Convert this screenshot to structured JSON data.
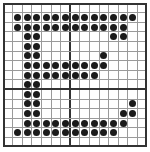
{
  "figure": {
    "grid": {
      "rows": 15,
      "cols": 15,
      "cell_px": 9.6,
      "thick_vertical_line_index": 7,
      "thick_horizontal_line_index": 9
    },
    "colors": {
      "dot": "#1a1a1a",
      "grid_line": "#9a9a9a",
      "thick_line": "#333333",
      "background": "#ffffff"
    },
    "dots_by_row": [
      [],
      [
        1,
        2,
        3,
        4,
        5,
        6,
        7,
        8,
        9,
        10,
        11,
        12,
        13
      ],
      [
        1,
        2,
        3,
        4,
        5,
        6,
        7,
        8,
        9,
        10,
        11,
        12
      ],
      [
        2,
        3,
        11,
        12
      ],
      [
        2,
        3
      ],
      [
        2,
        3,
        10
      ],
      [
        2,
        3,
        4,
        5,
        6,
        7,
        8,
        9,
        10
      ],
      [
        2,
        3,
        4,
        5,
        6,
        7,
        8,
        9
      ],
      [
        2,
        3
      ],
      [
        2,
        3
      ],
      [
        2,
        3,
        13
      ],
      [
        2,
        3,
        12,
        13
      ],
      [
        2,
        3,
        4,
        5,
        6,
        7,
        8,
        9,
        10,
        11,
        12
      ],
      [
        1,
        2,
        3,
        4,
        5,
        6,
        7,
        8,
        9,
        10,
        11
      ],
      []
    ]
  }
}
